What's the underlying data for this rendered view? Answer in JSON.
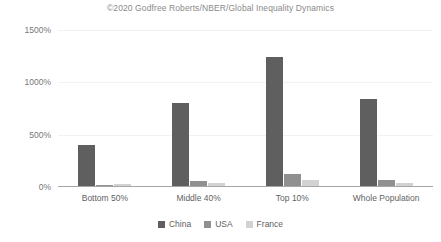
{
  "chart_data": {
    "type": "bar",
    "title": "©2020 Godfree Roberts/NBER/Global Inequality Dynamics",
    "xlabel": "",
    "ylabel": "",
    "ylim": [
      0,
      1500
    ],
    "yticks": [
      "0%",
      "500%",
      "1000%",
      "1500%"
    ],
    "ytick_values": [
      0,
      500,
      1000,
      1500
    ],
    "grid": false,
    "legend_position": "bottom",
    "categories": [
      "Bottom 50%",
      "Middle 40%",
      "Top 10%",
      "Whole Population"
    ],
    "series": [
      {
        "name": "China",
        "color": "#5f5f5f",
        "values": [
          390,
          795,
          1235,
          830
        ]
      },
      {
        "name": "USA",
        "color": "#909090",
        "values": [
          5,
          45,
          115,
          60
        ]
      },
      {
        "name": "France",
        "color": "#d2d2d2",
        "values": [
          20,
          25,
          55,
          30
        ]
      }
    ]
  },
  "legend": {
    "items": [
      {
        "label": "China"
      },
      {
        "label": "USA"
      },
      {
        "label": "France"
      }
    ]
  }
}
